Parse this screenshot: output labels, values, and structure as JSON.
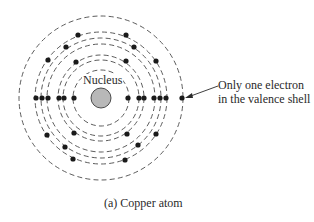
{
  "diagram": {
    "title": "Copper atom",
    "nucleus": {
      "label": "Nucleus",
      "cx": 101,
      "cy": 98,
      "r": 10,
      "color": "#b8b8b8"
    },
    "shells_radii": [
      28,
      38,
      43,
      54,
      60,
      66,
      82
    ],
    "electrons": [
      {
        "x": 36,
        "y": 98
      },
      {
        "x": 42,
        "y": 98
      },
      {
        "x": 48,
        "y": 98
      },
      {
        "x": 59,
        "y": 98
      },
      {
        "x": 64,
        "y": 98
      },
      {
        "x": 74,
        "y": 98
      },
      {
        "x": 128,
        "y": 98
      },
      {
        "x": 139,
        "y": 98
      },
      {
        "x": 144,
        "y": 98
      },
      {
        "x": 154,
        "y": 98
      },
      {
        "x": 160,
        "y": 98
      },
      {
        "x": 166,
        "y": 98
      },
      {
        "x": 182,
        "y": 98
      },
      {
        "x": 78,
        "y": 35
      },
      {
        "x": 126,
        "y": 35
      },
      {
        "x": 66,
        "y": 47
      },
      {
        "x": 134,
        "y": 47
      },
      {
        "x": 48,
        "y": 60
      },
      {
        "x": 76,
        "y": 62
      },
      {
        "x": 126,
        "y": 61
      },
      {
        "x": 156,
        "y": 61
      },
      {
        "x": 47,
        "y": 135
      },
      {
        "x": 74,
        "y": 133
      },
      {
        "x": 127,
        "y": 134
      },
      {
        "x": 156,
        "y": 134
      },
      {
        "x": 65,
        "y": 147
      },
      {
        "x": 138,
        "y": 145
      },
      {
        "x": 73,
        "y": 159
      },
      {
        "x": 125,
        "y": 160
      }
    ],
    "valence_annotation": {
      "line1": "Only one electron",
      "line2": "in the valence shell"
    },
    "caption": "(a) Copper atom"
  }
}
